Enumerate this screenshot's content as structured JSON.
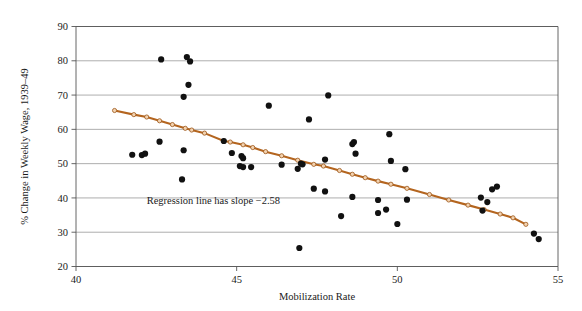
{
  "chart_data": {
    "type": "scatter",
    "title": "",
    "xlabel": "Mobilization Rate",
    "ylabel": "% Change in Weekly Wage, 1939–49",
    "xlim": [
      40,
      55
    ],
    "ylim": [
      20,
      90
    ],
    "xticks": [
      40,
      45,
      50,
      55
    ],
    "yticks": [
      20,
      30,
      40,
      50,
      60,
      70,
      80,
      90
    ],
    "xtick_labels": [
      "40",
      "45",
      "50",
      "55"
    ],
    "ytick_labels": [
      "20",
      "30",
      "40",
      "50",
      "60",
      "70",
      "80",
      "90"
    ],
    "grid": "horizontal",
    "legend": "none",
    "annotations": [
      {
        "text": "Regression line has slope −2.58",
        "x": 42.2,
        "y": 38.2
      }
    ],
    "series": [
      {
        "name": "States",
        "type": "scatter",
        "marker": "filled-circle",
        "color": "#111111",
        "points": [
          [
            42.65,
            80.4
          ],
          [
            43.45,
            81.1
          ],
          [
            43.55,
            79.8
          ],
          [
            43.5,
            73.0
          ],
          [
            43.35,
            69.5
          ],
          [
            47.85,
            69.9
          ],
          [
            46.0,
            66.9
          ],
          [
            47.25,
            62.9
          ],
          [
            49.75,
            58.6
          ],
          [
            48.65,
            56.3
          ],
          [
            48.6,
            55.7
          ],
          [
            44.6,
            56.6
          ],
          [
            42.6,
            56.4
          ],
          [
            43.35,
            53.9
          ],
          [
            48.7,
            52.9
          ],
          [
            47.75,
            51.2
          ],
          [
            49.8,
            50.8
          ],
          [
            41.75,
            52.6
          ],
          [
            42.05,
            52.5
          ],
          [
            42.15,
            52.9
          ],
          [
            44.85,
            53.1
          ],
          [
            45.15,
            52.2
          ],
          [
            45.2,
            51.6
          ],
          [
            45.1,
            49.3
          ],
          [
            45.2,
            49.0
          ],
          [
            45.45,
            49.0
          ],
          [
            46.4,
            49.7
          ],
          [
            47.0,
            50.0
          ],
          [
            46.9,
            48.5
          ],
          [
            47.05,
            49.8
          ],
          [
            50.25,
            48.4
          ],
          [
            43.3,
            45.4
          ],
          [
            47.4,
            42.7
          ],
          [
            47.75,
            41.9
          ],
          [
            52.95,
            42.5
          ],
          [
            53.1,
            43.3
          ],
          [
            48.6,
            40.3
          ],
          [
            49.4,
            39.4
          ],
          [
            50.3,
            39.5
          ],
          [
            52.6,
            40.1
          ],
          [
            52.8,
            38.8
          ],
          [
            52.65,
            36.3
          ],
          [
            49.4,
            35.6
          ],
          [
            49.65,
            36.6
          ],
          [
            48.25,
            34.7
          ],
          [
            50.0,
            32.4
          ],
          [
            54.25,
            29.6
          ],
          [
            54.4,
            28.0
          ],
          [
            46.95,
            25.4
          ]
        ]
      },
      {
        "name": "Regression line",
        "type": "line",
        "color": "#b4651f",
        "slope": -2.58,
        "endpoints": [
          [
            41.2,
            65.5
          ],
          [
            54.0,
            32.3
          ]
        ],
        "marker_points": [
          [
            41.2,
            65.5
          ],
          [
            41.8,
            64.3
          ],
          [
            42.2,
            63.6
          ],
          [
            42.6,
            62.5
          ],
          [
            43.0,
            61.4
          ],
          [
            43.4,
            60.3
          ],
          [
            43.6,
            59.8
          ],
          [
            44.0,
            58.9
          ],
          [
            44.6,
            56.6
          ],
          [
            44.8,
            56.3
          ],
          [
            45.2,
            55.5
          ],
          [
            45.5,
            54.7
          ],
          [
            45.9,
            53.5
          ],
          [
            46.4,
            52.3
          ],
          [
            46.9,
            51.0
          ],
          [
            47.4,
            49.8
          ],
          [
            47.7,
            49.3
          ],
          [
            48.2,
            48.0
          ],
          [
            48.6,
            46.9
          ],
          [
            49.0,
            45.9
          ],
          [
            49.4,
            44.9
          ],
          [
            49.8,
            44.0
          ],
          [
            50.3,
            42.8
          ],
          [
            51.0,
            41.0
          ],
          [
            51.6,
            39.4
          ],
          [
            52.2,
            37.9
          ],
          [
            52.7,
            36.6
          ],
          [
            53.2,
            35.3
          ],
          [
            53.6,
            34.2
          ],
          [
            54.0,
            32.3
          ]
        ]
      }
    ]
  },
  "figure": {
    "background_color": "#ffffff",
    "point_color": "#111111",
    "regression_color": "#b4651f",
    "grid_color": "#8a8a8a",
    "frame_color": "#555555"
  }
}
